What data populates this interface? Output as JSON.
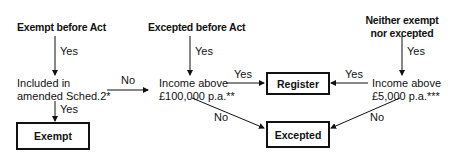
{
  "diagram": {
    "columns": [
      {
        "heading": "Exempt before Act",
        "arrow_label": "Yes",
        "decision": [
          "Included in",
          "amended Sched.2*"
        ],
        "yes_label": "Yes",
        "yes_result": "Exempt",
        "no_label": "No"
      },
      {
        "heading": "Excepted before Act",
        "arrow_label": "Yes",
        "decision": [
          "Income above",
          "£100,000 p.a.**"
        ],
        "yes_label": "Yes",
        "no_label": "No"
      },
      {
        "heading": [
          "Neither exempt",
          "nor excepted"
        ],
        "arrow_label": "Yes",
        "decision": [
          "Income above",
          "£5,000 p.a.***"
        ],
        "yes_label": "Yes",
        "no_label": "No"
      }
    ],
    "outcomes": {
      "register": "Register",
      "excepted": "Excepted",
      "exempt": "Exempt"
    }
  }
}
